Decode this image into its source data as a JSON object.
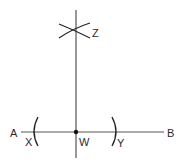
{
  "diagram": {
    "type": "perpendicular-bisector-construction",
    "stroke_color": "#222222",
    "line_color": "#555555",
    "labels": {
      "A": "A",
      "B": "B",
      "X": "X",
      "Y": "Y",
      "W": "W",
      "Z": "Z"
    },
    "points": {
      "A": {
        "x": 21,
        "y": 132
      },
      "B": {
        "x": 164,
        "y": 132
      },
      "W": {
        "x": 76,
        "y": 132
      },
      "Z": {
        "x": 75,
        "y": 30
      },
      "X": {
        "x": 36,
        "y": 132
      },
      "Y": {
        "x": 114,
        "y": 132
      }
    },
    "segments": [
      {
        "name": "line-AB",
        "from": "A",
        "to": "B"
      },
      {
        "name": "perpendicular-line",
        "from": [
          76,
          10
        ],
        "to": [
          76,
          158
        ]
      }
    ],
    "arcs": [
      {
        "name": "arc-X",
        "near": "X"
      },
      {
        "name": "arc-Y",
        "near": "Y"
      },
      {
        "name": "arc-Z-1",
        "near": "Z"
      },
      {
        "name": "arc-Z-2",
        "near": "Z"
      }
    ]
  }
}
